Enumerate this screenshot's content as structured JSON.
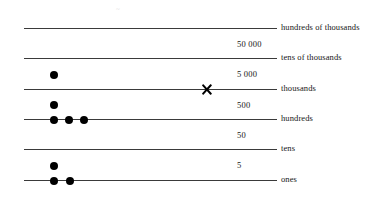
{
  "diagram": {
    "artifact_text": "~",
    "line_color": "#3a3a3a",
    "dot_color": "#000000",
    "cross_color": "#000000",
    "background": "#ffffff"
  },
  "rows": [
    {
      "key": "hundreds-of-thousands",
      "label": "hundreds of thousands",
      "line_top": 28,
      "label_top": 22,
      "dots_on_line": [],
      "dots_above": [],
      "cross": null
    },
    {
      "key": "tens-of-thousands",
      "label": "tens of thousands",
      "line_top": 58,
      "label_top": 52,
      "dots_on_line": [],
      "dots_above": [],
      "cross": null
    },
    {
      "key": "thousands",
      "label": "thousands",
      "line_top": 89,
      "label_top": 83,
      "dots_on_line": [],
      "dots_above": [
        54
      ],
      "cross": 207
    },
    {
      "key": "hundreds",
      "label": "hundreds",
      "line_top": 119,
      "label_top": 113,
      "dots_on_line": [
        54,
        69,
        84
      ],
      "dots_above": [
        54
      ],
      "cross": null
    },
    {
      "key": "tens",
      "label": "tens",
      "line_top": 149,
      "label_top": 143,
      "dots_on_line": [],
      "dots_above": [],
      "cross": null
    },
    {
      "key": "ones",
      "label": "ones",
      "line_top": 180,
      "label_top": 174,
      "dots_on_line": [
        54,
        70
      ],
      "dots_above": [
        54
      ],
      "cross": null
    }
  ],
  "mid_values": [
    {
      "key": "fifty-thousand",
      "text": "50 000",
      "top": 39
    },
    {
      "key": "five-thousand",
      "text": "5 000",
      "top": 69
    },
    {
      "key": "five-hundred",
      "text": "500",
      "top": 100
    },
    {
      "key": "fifty",
      "text": "50",
      "top": 130
    },
    {
      "key": "five",
      "text": "5",
      "top": 160
    }
  ],
  "geometry": {
    "line_left": 24,
    "line_right": 277,
    "label_left": 281,
    "mid_value_left": 237
  }
}
